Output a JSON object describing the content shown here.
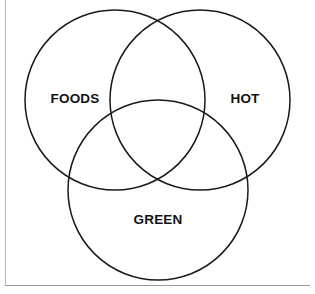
{
  "diagram": {
    "type": "venn",
    "title": "",
    "background_color": "#ffffff",
    "stroke_color": "#1a1a1a",
    "stroke_width": 1.5,
    "frame": {
      "border_color": "#b9b9bb",
      "visible": true
    },
    "sets": [
      {
        "id": "foods",
        "label": "FOODS",
        "circle": {
          "cx": 115,
          "cy": 100,
          "r": 90
        },
        "label_position": {
          "x": 75,
          "y": 98
        },
        "label_color": "#121212"
      },
      {
        "id": "hot",
        "label": "HOT",
        "circle": {
          "cx": 200,
          "cy": 100,
          "r": 90
        },
        "label_position": {
          "x": 245,
          "y": 98
        },
        "label_color": "#121212"
      },
      {
        "id": "green",
        "label": "GREEN",
        "circle": {
          "cx": 158,
          "cy": 190,
          "r": 90
        },
        "label_position": {
          "x": 158,
          "y": 219
        },
        "label_color": "#121212"
      }
    ]
  }
}
